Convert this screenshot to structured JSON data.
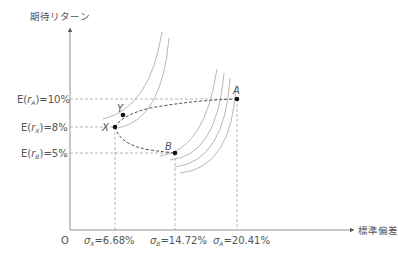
{
  "diagram": {
    "y_axis_label": "期待リターン",
    "x_axis_label": "標準偏差",
    "origin_label": "O",
    "y_levels": [
      {
        "id": "A",
        "label_pre": "E(",
        "label_sub": "r",
        "label_subsub": "A",
        "label_post": ")=10%",
        "value": 10
      },
      {
        "id": "X",
        "label_pre": "E(",
        "label_sub": "r",
        "label_subsub": "X",
        "label_post": ")=8%",
        "value": 8
      },
      {
        "id": "B",
        "label_pre": "E(",
        "label_sub": "r",
        "label_subsub": "B",
        "label_post": ")=5%",
        "value": 5
      }
    ],
    "x_levels": [
      {
        "id": "X",
        "sigma": "σ",
        "sub": "X",
        "label_post": "=6.68%",
        "value": 6.68
      },
      {
        "id": "B",
        "sigma": "σ",
        "sub": "B",
        "label_post": "=14.72%",
        "value": 14.72
      },
      {
        "id": "A",
        "sigma": "σ",
        "sub": "A",
        "label_post": "=20.41%",
        "value": 20.41
      }
    ],
    "points": [
      {
        "name": "A",
        "sd": 20.41,
        "ret": 10
      },
      {
        "name": "Y",
        "sd": 7.9,
        "ret": 9.0
      },
      {
        "name": "X",
        "sd": 6.68,
        "ret": 8
      },
      {
        "name": "B",
        "sd": 14.72,
        "ret": 5
      }
    ],
    "colors": {
      "axis": "#666666",
      "curve": "#999999",
      "dashed": "#444444",
      "point": "#111111",
      "text": "#555555"
    }
  }
}
